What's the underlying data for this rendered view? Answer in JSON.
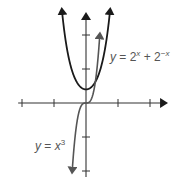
{
  "chart_data": {
    "type": "line",
    "title": "",
    "xlabel": "x",
    "ylabel": "y",
    "xlim": [
      -11,
      12
    ],
    "ylim": [
      -11,
      12
    ],
    "x_ticks": [
      -10,
      -5,
      5,
      10
    ],
    "y_ticks": [
      -10,
      -5,
      5,
      10
    ],
    "x_tick_labels": [
      "−10",
      "−5",
      "5",
      "10"
    ],
    "y_tick_labels": [
      "−5",
      "−10"
    ],
    "grid": false,
    "series": [
      {
        "name": "y = 2^x + 2^-x",
        "label_text": "y = 2",
        "label_sup1": "x",
        "label_mid": " + 2",
        "label_sup2": "−x",
        "color": "#1a1a1a",
        "x": [
          -3.8,
          -3,
          -2,
          -1,
          0,
          1,
          2,
          3,
          3.8
        ],
        "y": [
          14,
          8.1,
          4.25,
          2.5,
          2,
          2.5,
          4.25,
          8.1,
          14
        ]
      },
      {
        "name": "y = x^3",
        "label_text": "y = x",
        "label_sup": "3",
        "color": "#555555",
        "x": [
          -2.2,
          -2,
          -1.5,
          -1,
          -0.5,
          0,
          0.5,
          1,
          1.5,
          2,
          2.2
        ],
        "y": [
          -10.6,
          -8,
          -3.4,
          -1,
          -0.125,
          0,
          0.125,
          1,
          3.4,
          8,
          10.6
        ]
      }
    ]
  }
}
